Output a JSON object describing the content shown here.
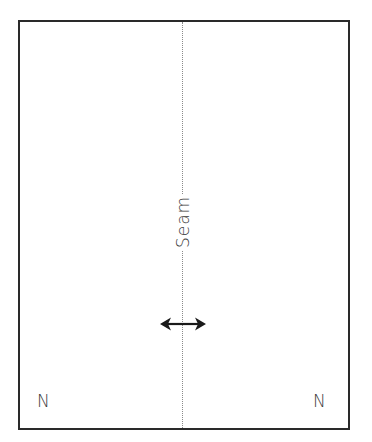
{
  "diagram": {
    "seam_label": "Seam",
    "corner_labels": {
      "bottom_left": "N",
      "bottom_right": "N"
    },
    "arrow": "double-headed-horizontal-arrow",
    "colors": {
      "border": "#2a2a2a",
      "seam_line": "#8a8a8a",
      "text": "#3a3a3a",
      "background": "#ffffff"
    }
  }
}
